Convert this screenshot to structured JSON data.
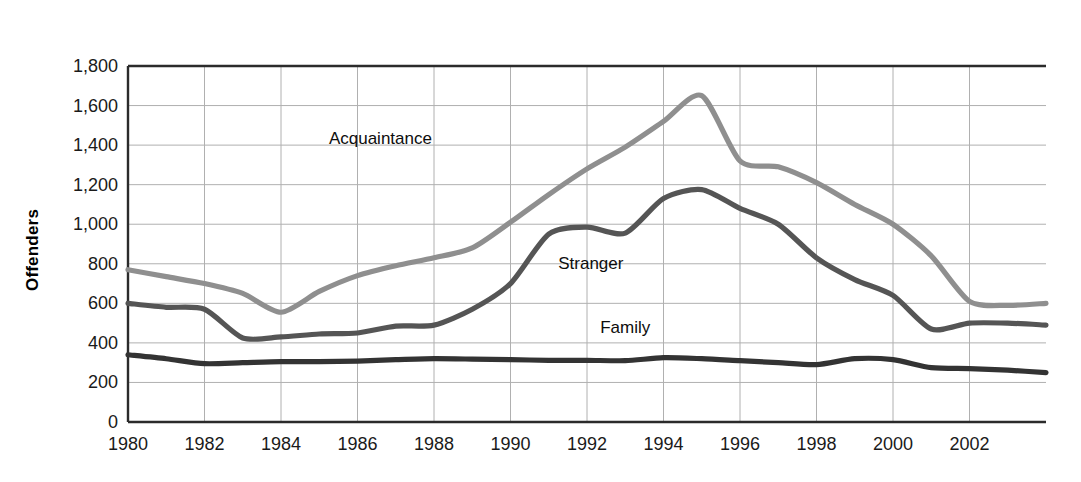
{
  "chart_data": {
    "type": "line",
    "title": "",
    "xlabel": "",
    "ylabel": "Offenders",
    "xlim": [
      1980,
      2004
    ],
    "ylim": [
      0,
      1800
    ],
    "grid": true,
    "legend_position": "inline-labels",
    "ytick_labels": [
      "1,800",
      "1,600",
      "1,400",
      "1,200",
      "1,000",
      "800",
      "600",
      "400",
      "200",
      "0"
    ],
    "ytick_values": [
      1800,
      1600,
      1400,
      1200,
      1000,
      800,
      600,
      400,
      200,
      0
    ],
    "xtick_labels": [
      "1980",
      "1982",
      "1984",
      "1986",
      "1988",
      "1990",
      "1992",
      "1994",
      "1996",
      "1998",
      "2000",
      "2002"
    ],
    "xtick_values": [
      1980,
      1982,
      1984,
      1986,
      1988,
      1990,
      1992,
      1994,
      1996,
      1998,
      2000,
      2002
    ],
    "x": [
      1980,
      1981,
      1982,
      1983,
      1984,
      1985,
      1986,
      1987,
      1988,
      1989,
      1990,
      1991,
      1992,
      1993,
      1994,
      1995,
      1996,
      1997,
      1998,
      1999,
      2000,
      2001,
      2002,
      2003,
      2004
    ],
    "series": [
      {
        "name": "Acquaintance",
        "color": "#8f8f8f",
        "label_x": 1986.6,
        "label_y": 1430,
        "values": [
          770,
          735,
          700,
          650,
          555,
          660,
          740,
          790,
          830,
          880,
          1010,
          1150,
          1280,
          1390,
          1520,
          1650,
          1320,
          1290,
          1210,
          1100,
          1000,
          840,
          610,
          590,
          600
        ]
      },
      {
        "name": "Stranger",
        "color": "#555555",
        "label_x": 1992.1,
        "label_y": 800,
        "values": [
          600,
          580,
          570,
          425,
          430,
          445,
          450,
          485,
          490,
          570,
          700,
          950,
          985,
          955,
          1130,
          1175,
          1080,
          1000,
          830,
          720,
          640,
          470,
          500,
          500,
          490
        ]
      },
      {
        "name": "Family",
        "color": "#333333",
        "label_x": 1993.0,
        "label_y": 475,
        "values": [
          340,
          320,
          295,
          300,
          305,
          305,
          308,
          315,
          320,
          318,
          315,
          312,
          312,
          310,
          325,
          320,
          310,
          300,
          290,
          320,
          315,
          275,
          270,
          262,
          250
        ]
      }
    ]
  },
  "geometry": {
    "plot_left": 128,
    "plot_right": 1046,
    "plot_top": 66,
    "plot_bottom": 422
  }
}
